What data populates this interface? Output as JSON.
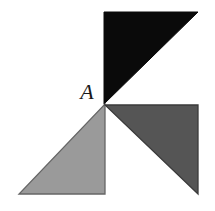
{
  "figure": {
    "canvas": {
      "width": 215,
      "height": 211,
      "background": "#ffffff"
    },
    "labels": [
      {
        "id": "vertex-a",
        "text": "A",
        "x": 87,
        "y": 99,
        "font_size": 22,
        "color": "#1a1a1a",
        "anchor": "middle"
      }
    ],
    "shapes": [
      {
        "id": "black-triangle",
        "name": "upper-right-black-triangle",
        "type": "triangle",
        "fill": "#0a0a0a",
        "stroke": "#0a0a0a",
        "stroke_width": 1,
        "points": "104,12 198,12 104,104",
        "vertices": [
          {
            "x": 104,
            "y": 12
          },
          {
            "x": 198,
            "y": 12
          },
          {
            "x": 104,
            "y": 104
          }
        ],
        "right_angle_at": {
          "x": 104,
          "y": 12
        },
        "legs": {
          "horizontal": 94,
          "vertical": 92
        }
      },
      {
        "id": "light-gray-triangle",
        "name": "lower-left-light-gray-triangle",
        "type": "triangle",
        "fill": "#9a9a9a",
        "stroke": "#666666",
        "stroke_width": 1.3,
        "points": "105,104 105,194 19,194",
        "vertices": [
          {
            "x": 105,
            "y": 104
          },
          {
            "x": 105,
            "y": 194
          },
          {
            "x": 19,
            "y": 194
          }
        ],
        "right_angle_at": {
          "x": 105,
          "y": 194
        },
        "legs": {
          "horizontal": 86,
          "vertical": 90
        }
      },
      {
        "id": "dark-gray-triangle",
        "name": "lower-right-dark-gray-triangle",
        "type": "triangle",
        "fill": "#555555",
        "stroke": "#3a3a3a",
        "stroke_width": 1.3,
        "points": "105,105 198,105 198,194",
        "vertices": [
          {
            "x": 105,
            "y": 105
          },
          {
            "x": 198,
            "y": 105
          },
          {
            "x": 198,
            "y": 194
          }
        ],
        "right_angle_at": {
          "x": 198,
          "y": 105
        },
        "legs": {
          "horizontal": 93,
          "vertical": 89
        }
      }
    ],
    "common_vertex": {
      "label": "A",
      "x": 105,
      "y": 104
    },
    "colors": {
      "black": "#0a0a0a",
      "light_gray": "#9a9a9a",
      "dark_gray": "#555555",
      "background": "#ffffff",
      "label": "#1a1a1a"
    }
  }
}
